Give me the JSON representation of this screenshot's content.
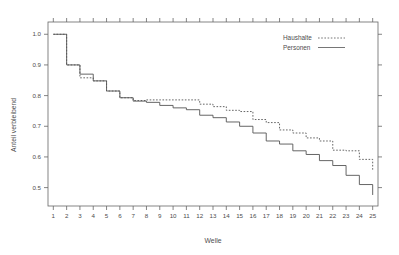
{
  "chart_data": {
    "type": "line",
    "subtype": "step",
    "title": "",
    "xlabel": "Welle",
    "ylabel": "Anteil verbleibend",
    "xlim": [
      0.6,
      25.4
    ],
    "ylim": [
      0.44,
      1.04
    ],
    "xticks": [
      1,
      2,
      3,
      4,
      5,
      6,
      7,
      8,
      9,
      10,
      11,
      12,
      13,
      14,
      15,
      16,
      17,
      18,
      19,
      20,
      21,
      22,
      23,
      24,
      25
    ],
    "xtick_labels": [
      "1",
      "2",
      "3",
      "4",
      "5",
      "6",
      "7",
      "8",
      "9",
      "10",
      "11",
      "12",
      "13",
      "14",
      "15",
      "16",
      "17",
      "18",
      "19",
      "20",
      "21",
      "22",
      "23",
      "24",
      "25"
    ],
    "yticks": [
      0.5,
      0.6,
      0.7,
      0.8,
      0.9,
      1.0
    ],
    "ytick_labels": [
      "0.5",
      "0.6",
      "0.7",
      "0.8",
      "0.9",
      "1.0"
    ],
    "grid": false,
    "legend_position": "top-right",
    "x": [
      1,
      2,
      3,
      4,
      5,
      6,
      7,
      8,
      9,
      10,
      11,
      12,
      13,
      14,
      15,
      16,
      17,
      18,
      19,
      20,
      21,
      22,
      23,
      24,
      25
    ],
    "series": [
      {
        "name": "Haushalte",
        "style": "dotted",
        "color": "#555555",
        "values": [
          1.0,
          0.9,
          0.858,
          0.848,
          0.815,
          0.793,
          0.784,
          0.786,
          0.786,
          0.786,
          0.786,
          0.772,
          0.764,
          0.752,
          0.748,
          0.722,
          0.712,
          0.688,
          0.678,
          0.662,
          0.652,
          0.622,
          0.62,
          0.592,
          0.556
        ]
      },
      {
        "name": "Personen",
        "style": "solid",
        "color": "#555555",
        "values": [
          1.0,
          0.9,
          0.87,
          0.848,
          0.815,
          0.793,
          0.782,
          0.778,
          0.768,
          0.76,
          0.754,
          0.736,
          0.728,
          0.714,
          0.7,
          0.678,
          0.652,
          0.642,
          0.62,
          0.608,
          0.588,
          0.572,
          0.54,
          0.51,
          0.476
        ]
      }
    ]
  },
  "legend": {
    "entries": [
      {
        "label": "Haushalte",
        "style": "dotted"
      },
      {
        "label": "Personen",
        "style": "solid"
      }
    ]
  },
  "axis": {
    "x_title": "Welle",
    "y_title": "Anteil verbleibend"
  }
}
